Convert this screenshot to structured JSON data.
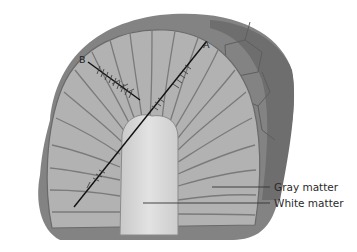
{
  "figure": {
    "points": {
      "a": "A",
      "b": "B"
    },
    "labels": {
      "gray_matter": "Gray matter",
      "white_matter": "White matter"
    },
    "colors": {
      "background": "#ffffff",
      "outer_tissue": "#7a7a7a",
      "gray_matter": "#a9a9a9",
      "gray_matter_light": "#bdbdbd",
      "white_matter": "#d6d6d6",
      "lines": "#111111"
    }
  }
}
